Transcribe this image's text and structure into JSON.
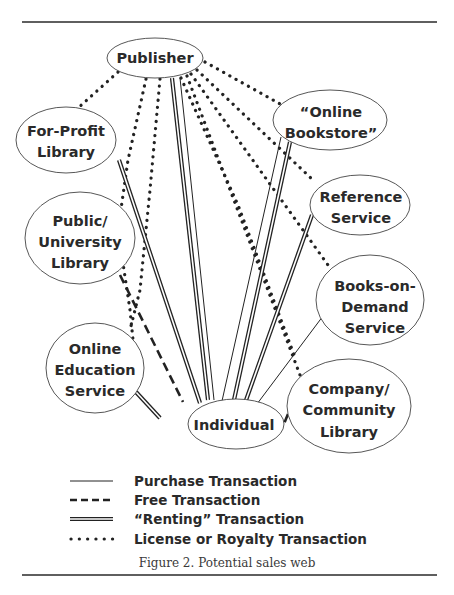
{
  "figure": {
    "caption": "Figure 2. Potential sales web",
    "nodes": {
      "publisher": {
        "lines": [
          "Publisher"
        ]
      },
      "for_profit_library": {
        "lines": [
          "For-Profit",
          "Library"
        ]
      },
      "online_bookstore": {
        "lines": [
          "“Online",
          "Bookstore”"
        ]
      },
      "reference_service": {
        "lines": [
          "Reference",
          "Service"
        ]
      },
      "public_university_library": {
        "lines": [
          "Public/",
          "University",
          "Library"
        ]
      },
      "books_on_demand": {
        "lines": [
          "Books-on-",
          "Demand",
          "Service"
        ]
      },
      "online_education": {
        "lines": [
          "Online",
          "Education",
          "Service"
        ]
      },
      "individual": {
        "lines": [
          "Individual"
        ]
      },
      "company_community_library": {
        "lines": [
          "Company/",
          "Community",
          "Library"
        ]
      }
    },
    "edges": [
      {
        "from": "Publisher",
        "to": "For-Profit Library",
        "type": "license"
      },
      {
        "from": "Publisher",
        "to": "Public/University Library",
        "type": "license"
      },
      {
        "from": "Publisher",
        "to": "Online Education Service",
        "type": "license"
      },
      {
        "from": "Publisher",
        "to": "“Online Bookstore”",
        "type": "license"
      },
      {
        "from": "Publisher",
        "to": "Reference Service",
        "type": "license"
      },
      {
        "from": "Publisher",
        "to": "Books-on-Demand Service",
        "type": "license"
      },
      {
        "from": "Publisher",
        "to": "Company/Community Library",
        "type": "license"
      },
      {
        "from": "Publisher",
        "to": "Individual",
        "type": "renting"
      },
      {
        "from": "Publisher",
        "to": "Individual",
        "type": "purchase"
      },
      {
        "from": "For-Profit Library",
        "to": "Individual",
        "type": "renting"
      },
      {
        "from": "Public/University Library",
        "to": "Individual",
        "type": "free"
      },
      {
        "from": "Online Education Service",
        "to": "Individual",
        "type": "renting"
      },
      {
        "from": "“Online Bookstore”",
        "to": "Individual",
        "type": "purchase"
      },
      {
        "from": "“Online Bookstore”",
        "to": "Individual",
        "type": "renting"
      },
      {
        "from": "Reference Service",
        "to": "Individual",
        "type": "renting"
      },
      {
        "from": "Books-on-Demand Service",
        "to": "Individual",
        "type": "purchase"
      },
      {
        "from": "Company/Community Library",
        "to": "Individual",
        "type": "free"
      }
    ]
  },
  "legend": {
    "items": [
      {
        "style": "purchase",
        "label": "Purchase Transaction"
      },
      {
        "style": "free",
        "label": "Free Transaction"
      },
      {
        "style": "renting",
        "label": "“Renting” Transaction"
      },
      {
        "style": "license",
        "label": "License or Royalty Transaction"
      }
    ]
  }
}
